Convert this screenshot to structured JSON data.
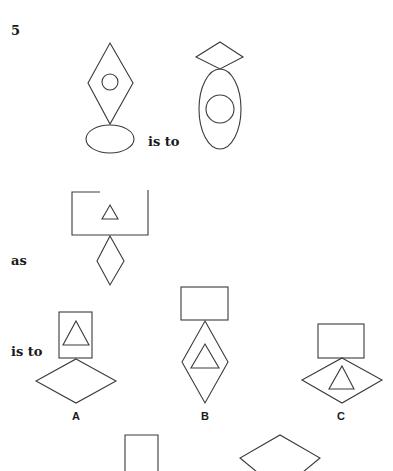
{
  "question": {
    "number": "5",
    "connector_is_to_1": "is to",
    "connector_as": "as",
    "connector_is_to_2": "is to"
  },
  "figures": {
    "figure1": {
      "description": "Tall diamond with small circle inside, resting on a horizontal ellipse"
    },
    "figure2": {
      "description": "Small wide diamond on top of a tall vertical ellipse with a circle inside"
    },
    "figure3": {
      "description": "Wide rectangle with small triangle inside, resting on a small tall diamond"
    }
  },
  "options": [
    {
      "label": "A",
      "description": "Tall rectangle with triangle inside, on top of a wide diamond"
    },
    {
      "label": "B",
      "description": "Wide rectangle on top of a tall diamond with triangle inside"
    },
    {
      "label": "C",
      "description": "Wide rectangle on top of a wide diamond with triangle inside"
    }
  ],
  "partial_option": {
    "description": "Partially visible: tall rectangle and wide diamond (cut off at bottom)"
  },
  "colors": {
    "stroke": "#3a3a3a",
    "background": "#ffffff",
    "text": "#1a1a1a"
  }
}
